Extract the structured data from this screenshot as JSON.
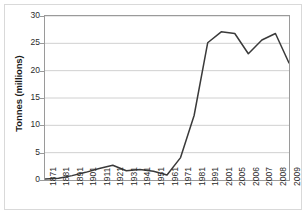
{
  "chart_data": {
    "type": "line",
    "title": "",
    "xlabel": "",
    "ylabel": "Tonnes (millions)",
    "categories": [
      "1871",
      "1881",
      "1891",
      "1901",
      "1911",
      "1921",
      "1931",
      "1941",
      "1951",
      "1961",
      "1971",
      "1981",
      "1991",
      "2001",
      "2005",
      "2006",
      "2007",
      "2008",
      "2009"
    ],
    "values": [
      0.2,
      0.3,
      0.8,
      1.4,
      2.1,
      2.7,
      1.7,
      1.9,
      1.6,
      0.9,
      4.1,
      11.8,
      25.1,
      27.1,
      26.8,
      23.1,
      25.6,
      26.8,
      21.4
    ],
    "series": [
      {
        "name": "Tonnes (millions)",
        "values": [
          0.2,
          0.3,
          0.8,
          1.4,
          2.1,
          2.7,
          1.7,
          1.9,
          1.6,
          0.9,
          4.1,
          11.8,
          25.1,
          27.1,
          26.8,
          23.1,
          25.6,
          26.8,
          21.4
        ]
      }
    ],
    "ylim": [
      0,
      30
    ],
    "yticks": [
      0,
      5,
      10,
      15,
      20,
      25,
      30
    ],
    "ytick_labels": [
      "0",
      "5",
      "10",
      "15",
      "20",
      "25",
      "30"
    ],
    "grid": "horizontal",
    "legend": "none",
    "line_color": "#3a3a3a",
    "grid_color": "#d0d0d0",
    "axis_color": "#9a9a9a",
    "background": "#ffffff"
  }
}
